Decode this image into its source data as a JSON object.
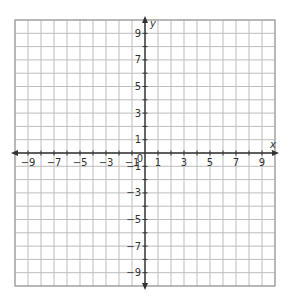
{
  "chart_data": {
    "type": "coordinate-grid",
    "title": "",
    "xlabel": "x",
    "ylabel": "y",
    "xlim": [
      -10,
      10
    ],
    "ylim": [
      -10,
      10
    ],
    "grid": true,
    "grid_step": 1,
    "x_tick_labels": [
      "-9",
      "-7",
      "-5",
      "-3",
      "-1",
      "1",
      "3",
      "5",
      "7",
      "9"
    ],
    "y_tick_labels": [
      "9",
      "7",
      "5",
      "3",
      "1",
      "-1",
      "-3",
      "-5",
      "-7",
      "-9"
    ],
    "origin_label": "0",
    "series": []
  },
  "colors": {
    "grid": "#bdbdbd",
    "axis": "#333333",
    "border": "#9e9e9e"
  }
}
